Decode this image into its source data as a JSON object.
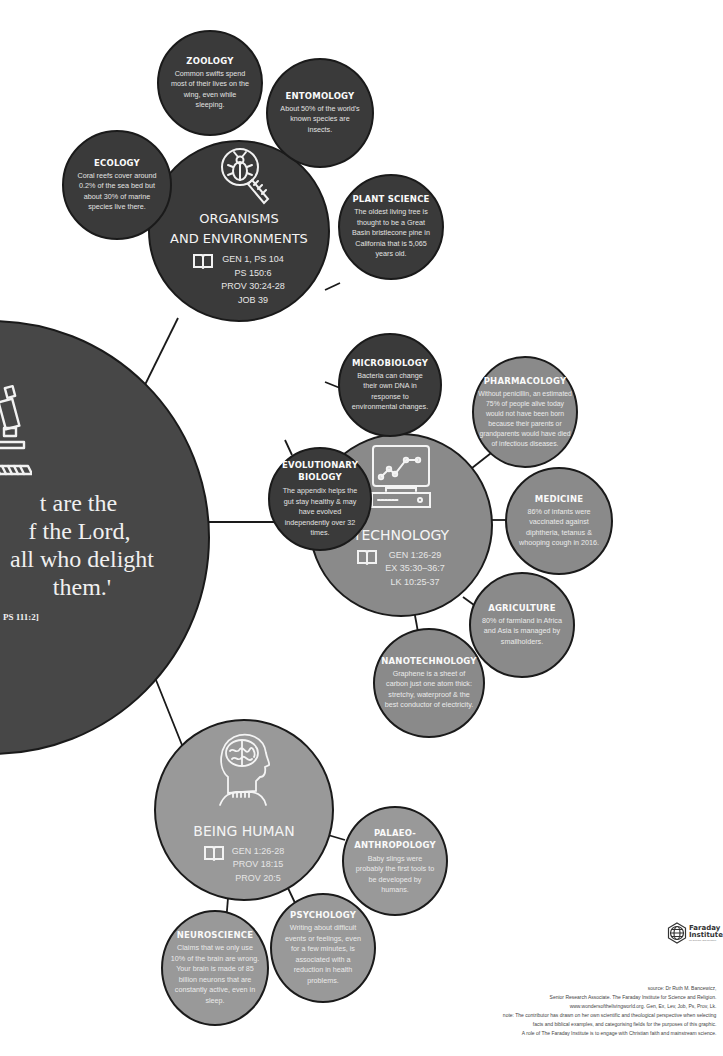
{
  "main_hub": {
    "quote_lines": [
      "t are the",
      "f the Lord,",
      "all who delight",
      "them.'"
    ],
    "reference": "PS 111:2]",
    "icon": "microscope-icon"
  },
  "hubs": [
    {
      "id": "organisms",
      "title_lines": [
        "ORGANISMS",
        "AND ENVIRONMENTS"
      ],
      "icon": "beetle-magnifier-icon",
      "refs": [
        "GEN 1, PS 104",
        "PS 150:6",
        "PROV 30:24-28",
        "JOB 39"
      ]
    },
    {
      "id": "technology",
      "title_lines": [
        "TECHNOLOGY"
      ],
      "icon": "computer-chart-icon",
      "refs": [
        "GEN 1:26-29",
        "EX 35:30–36:7",
        "LK 10:25-37"
      ]
    },
    {
      "id": "being-human",
      "title_lines": [
        "BEING HUMAN"
      ],
      "icon": "head-brain-icon",
      "refs": [
        "GEN 1:26-28",
        "PROV 18:15",
        "PROV 20:5"
      ]
    }
  ],
  "facts": {
    "ecology": {
      "title": "ECOLOGY",
      "text": "Coral reefs cover around 0.2% of the sea bed but about 30% of marine species live there."
    },
    "zoology": {
      "title": "ZOOLOGY",
      "text": "Common swifts spend most of their lives on the wing, even while sleeping."
    },
    "entomology": {
      "title": "ENTOMOLOGY",
      "text": "About 50% of the world's known species are insects."
    },
    "plant_science": {
      "title": "PLANT SCIENCE",
      "text": "The oldest living tree is thought to be a Great Basin bristlecone pine in California that is 5,065 years old."
    },
    "microbiology": {
      "title": "MICROBIOLOGY",
      "text": "Bacteria can change their own DNA in response to environmental changes."
    },
    "evolutionary_biology": {
      "title": "EVOLUTIONARY BIOLOGY",
      "text": "The appendix helps the gut stay healthy & may have evolved independently over 32 times."
    },
    "pharmacology": {
      "title": "PHARMACOLOGY",
      "text": "Without penicillin, an estimated 75% of people alive today would not have been born because their parents or grandparents would have died of infectious diseases."
    },
    "medicine": {
      "title": "MEDICINE",
      "text": "86% of infants were vaccinated against diphtheria, tetanus & whooping cough in 2016."
    },
    "agriculture": {
      "title": "AGRICULTURE",
      "text": "80% of farmland in Africa and Asia is managed by smallholders."
    },
    "nanotechnology": {
      "title": "NANOTECHNOLOGY",
      "text": "Graphene is a sheet of carbon just one atom thick: stretchy, waterproof & the best conductor of electricity."
    },
    "palaeoanthropology": {
      "title": "PALAEO-ANTHROPOLOGY",
      "text": "Baby slings were probably the first tools to be developed by humans."
    },
    "psychology": {
      "title": "PSYCHOLOGY",
      "text": "Writing about difficult events or feelings, even for a few minutes, is associated with a reduction in health problems."
    },
    "neuroscience": {
      "title": "NEUROSCIENCE",
      "text": "Claims that we only use 10% of the brain are wrong. Your brain is made of 85 billion neurons that are constantly active, even in sleep."
    }
  },
  "logo": {
    "line1": "Faraday",
    "line2": "Institute",
    "tiny": "for Science and Religion"
  },
  "footer": {
    "lines": [
      "source: Dr Ruth M. Bancewicz,",
      "Senior Research Associate.  The Faraday Institute for Science and Religion.",
      "www.wondersofthelivingworld.org. Gen, Ex, Lev, Job, Ps, Prov, Lk.",
      "note: The contributor has drawn on her own scientific and theological perspective when selecting",
      "facts and biblical examples, and categorising fields for the purposes of this graphic.",
      "A role of The Faraday Institute is to engage with Christian faith and mainstream science."
    ]
  },
  "colors": {
    "dark_circle": "#3a3a3a",
    "light_circle": "#8a8a8a",
    "outline": "#1a1a1a",
    "text": "#f2f2f2"
  }
}
